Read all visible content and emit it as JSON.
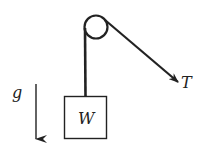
{
  "diagram": {
    "type": "pulley-free-body",
    "labels": {
      "gravity": "g",
      "weight": "W",
      "tension": "T"
    },
    "colors": {
      "stroke": "#222222",
      "background": "#ffffff"
    }
  }
}
